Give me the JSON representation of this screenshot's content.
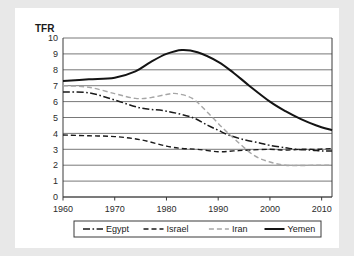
{
  "figure": {
    "background_color": "#e8e8e8",
    "card_color": "#ffffff"
  },
  "chart_data": {
    "type": "line",
    "title": "",
    "subtitle": "",
    "xlabel": "",
    "ylabel": "TFR",
    "ylabel_position": "top-left",
    "xlim": [
      1960,
      2012
    ],
    "ylim": [
      0,
      10
    ],
    "yticks": [
      0,
      1,
      2,
      3,
      4,
      5,
      6,
      7,
      8,
      9,
      10
    ],
    "ytick_labels": [
      "0",
      "1",
      "2",
      "3",
      "4",
      "5",
      "6",
      "7",
      "8",
      "9",
      "10"
    ],
    "xticks": [
      1960,
      1970,
      1980,
      1990,
      2000,
      2010
    ],
    "xtick_labels": [
      "1960",
      "1970",
      "1980",
      "1990",
      "2000",
      "2010"
    ],
    "grid": "horizontal",
    "grid_color": "#555555",
    "legend_position": "bottom-center",
    "legend_entries": [
      "Egypt",
      "Israel",
      "Iran",
      "Yemen"
    ],
    "series": [
      {
        "name": "Egypt",
        "color": "#1a1a1a",
        "dash": "dashdot",
        "dasharray": "7,2.5,1.6,2.5",
        "width": 1.5,
        "x": [
          1960,
          1965,
          1970,
          1975,
          1980,
          1985,
          1988,
          1990,
          1992,
          1995,
          1998,
          2000,
          2003,
          2005,
          2008,
          2010,
          2012
        ],
        "values": [
          6.6,
          6.55,
          6.1,
          5.6,
          5.4,
          5.0,
          4.5,
          4.2,
          3.9,
          3.6,
          3.4,
          3.25,
          3.1,
          3.0,
          2.95,
          2.9,
          2.9
        ]
      },
      {
        "name": "Israel",
        "color": "#1a1a1a",
        "dash": "dashed",
        "dasharray": "5,3",
        "width": 1.4,
        "x": [
          1960,
          1965,
          1970,
          1975,
          1980,
          1983,
          1986,
          1990,
          1993,
          1996,
          2000,
          2003,
          2006,
          2009,
          2012
        ],
        "values": [
          3.9,
          3.85,
          3.8,
          3.6,
          3.2,
          3.05,
          3.0,
          2.85,
          2.9,
          2.95,
          3.0,
          2.95,
          3.0,
          3.0,
          3.05
        ]
      },
      {
        "name": "Iran",
        "color": "#a6a6a6",
        "dash": "dashed",
        "dasharray": "5,3",
        "width": 1.4,
        "x": [
          1960,
          1965,
          1970,
          1974,
          1977,
          1980,
          1982,
          1985,
          1988,
          1991,
          1994,
          1997,
          2000,
          2003,
          2006,
          2009,
          2012
        ],
        "values": [
          7.0,
          6.9,
          6.5,
          6.2,
          6.25,
          6.45,
          6.5,
          6.2,
          5.3,
          4.3,
          3.4,
          2.6,
          2.2,
          2.0,
          1.98,
          2.0,
          2.0
        ]
      },
      {
        "name": "Yemen",
        "color": "#141414",
        "dash": "solid",
        "dasharray": "none",
        "width": 2.0,
        "x": [
          1960,
          1965,
          1970,
          1974,
          1977,
          1980,
          1983,
          1986,
          1990,
          1993,
          1996,
          2000,
          2003,
          2006,
          2009,
          2012
        ],
        "values": [
          7.3,
          7.4,
          7.5,
          7.9,
          8.5,
          9.0,
          9.25,
          9.1,
          8.5,
          7.8,
          7.0,
          6.0,
          5.4,
          4.9,
          4.5,
          4.2
        ]
      }
    ]
  }
}
